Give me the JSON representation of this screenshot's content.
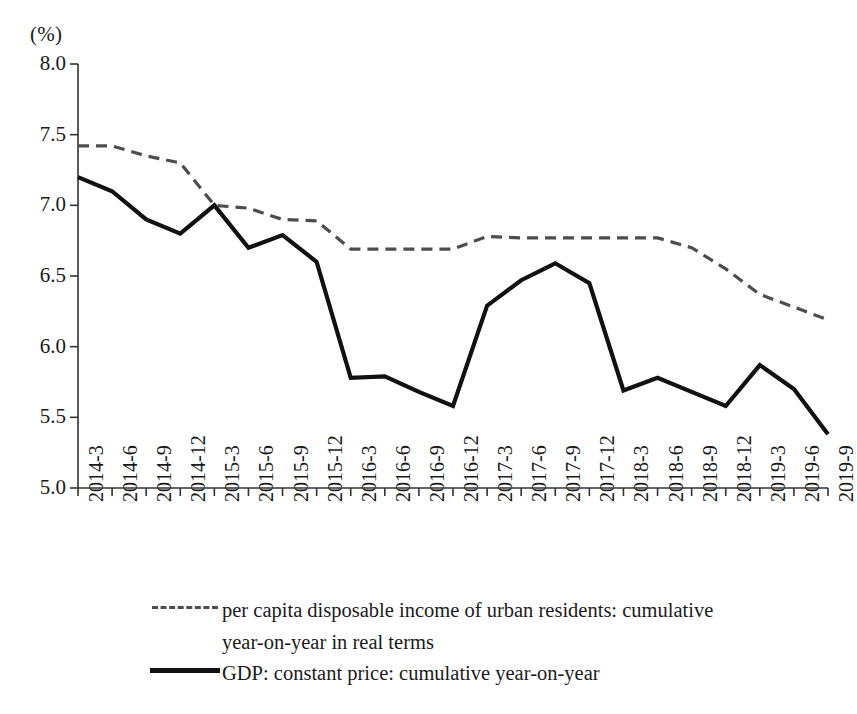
{
  "chart_data": {
    "type": "line",
    "title": "",
    "xlabel": "",
    "ylabel": "(%)",
    "ylim": [
      5.0,
      8.0
    ],
    "ytick_labels": [
      "8.0",
      "7.5",
      "7.0",
      "6.5",
      "6.0",
      "5.5",
      "5.0"
    ],
    "ytick_values": [
      8.0,
      7.5,
      7.0,
      6.5,
      6.0,
      5.5,
      5.0
    ],
    "grid": false,
    "legend_position": "bottom-left",
    "categories": [
      "2014-3",
      "2014-6",
      "2014-9",
      "2014-12",
      "2015-3",
      "2015-6",
      "2015-9",
      "2015-12",
      "2016-3",
      "2016-6",
      "2016-9",
      "2016-12",
      "2017-3",
      "2017-6",
      "2017-9",
      "2017-12",
      "2018-3",
      "2018-6",
      "2018-9",
      "2018-12",
      "2019-3",
      "2019-6",
      "2019-9"
    ],
    "series": [
      {
        "name": "per capita disposable income of urban residents: cumulative year-on-year in real terms",
        "style": "dashed",
        "color": "#4d4d4d",
        "values": [
          7.42,
          7.42,
          7.35,
          7.3,
          7.0,
          6.98,
          6.9,
          6.89,
          6.69,
          6.69,
          6.69,
          6.69,
          6.78,
          6.77,
          6.77,
          6.77,
          6.77,
          6.77,
          6.7,
          6.55,
          6.37,
          6.28,
          6.19
        ]
      },
      {
        "name": "GDP: constant price: cumulative year-on-year",
        "style": "solid",
        "color": "#111111",
        "values": [
          7.2,
          7.1,
          6.9,
          6.8,
          7.0,
          6.7,
          6.79,
          6.6,
          5.78,
          5.79,
          5.68,
          5.58,
          6.29,
          6.47,
          6.59,
          6.45,
          5.69,
          5.78,
          5.68,
          5.58,
          5.87,
          5.7,
          5.38
        ]
      }
    ]
  },
  "legend": {
    "entries": [
      {
        "line1": "per capita disposable income of urban residents: cumulative",
        "line2": "year-on-year in real terms",
        "marker": "dashed-line-icon"
      },
      {
        "line1": "GDP: constant price: cumulative year-on-year",
        "line2": "",
        "marker": "solid-line-icon"
      }
    ]
  },
  "axes": {
    "y_unit_label": "(%)",
    "axis_color": "#333333"
  }
}
